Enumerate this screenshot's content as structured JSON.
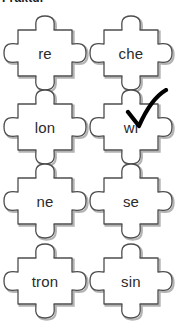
{
  "header": {
    "text": "Fraktur",
    "note_truncated": true
  },
  "board": {
    "columns": 2,
    "rows": 4,
    "piece_shape": "jigsaw-piece-socket-left-tab-top-tab-right-tab-bottom",
    "outline_color": "#4d4d4d",
    "fill_color": "#ffffff",
    "shadow_color": "#b3b3b3",
    "text_color": "#2b2b2b",
    "pieces": [
      {
        "id": "piece-re",
        "label": "re",
        "row": 1,
        "col": 1,
        "checked": false
      },
      {
        "id": "piece-che",
        "label": "che",
        "row": 1,
        "col": 2,
        "checked": false
      },
      {
        "id": "piece-lon",
        "label": "lon",
        "row": 2,
        "col": 1,
        "checked": false
      },
      {
        "id": "piece-wi",
        "label": "wi",
        "row": 2,
        "col": 2,
        "checked": true
      },
      {
        "id": "piece-ne",
        "label": "ne",
        "row": 3,
        "col": 1,
        "checked": false
      },
      {
        "id": "piece-se",
        "label": "se",
        "row": 3,
        "col": 2,
        "checked": false
      },
      {
        "id": "piece-tron",
        "label": "tron",
        "row": 4,
        "col": 1,
        "checked": false
      },
      {
        "id": "piece-sin",
        "label": "sin",
        "row": 4,
        "col": 2,
        "checked": false
      }
    ]
  },
  "check_mark": {
    "glyph": "✓",
    "color": "#000000",
    "target_piece": "piece-wi"
  }
}
